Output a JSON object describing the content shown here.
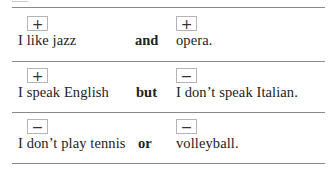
{
  "table": {
    "rows": [
      {
        "left": {
          "sign": "+",
          "text": "I like jazz"
        },
        "conjunction": "and",
        "right": {
          "sign": "+",
          "text": "opera."
        }
      },
      {
        "left": {
          "sign": "+",
          "text": "I speak English"
        },
        "conjunction": "but",
        "right": {
          "sign": "−",
          "text": "I don’t speak Italian."
        }
      },
      {
        "left": {
          "sign": "−",
          "text": "I don’t play tennis"
        },
        "conjunction": "or",
        "right": {
          "sign": "−",
          "text": "volleyball."
        }
      }
    ]
  },
  "colors": {
    "rule": "#8a8a8a",
    "box_border": "#b4b4b4",
    "text": "#222222"
  }
}
